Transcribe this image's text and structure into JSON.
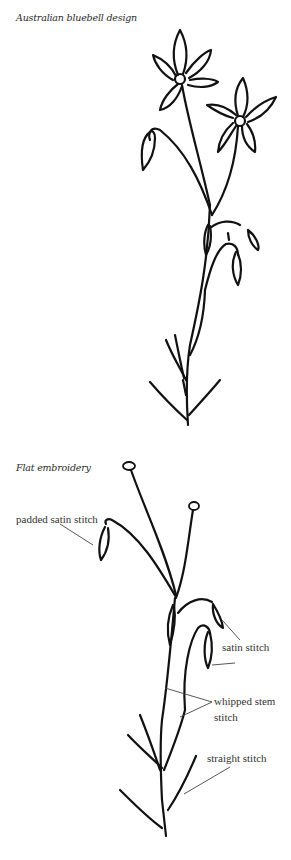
{
  "figures": [
    {
      "caption": "Australian bluebell design"
    },
    {
      "caption": "Flat embroidery",
      "labels": [
        {
          "id": "padded-satin",
          "text": "padded satin stitch"
        },
        {
          "id": "satin",
          "text": "satin stitch"
        },
        {
          "id": "whipped-stem-1",
          "text": "whipped stem"
        },
        {
          "id": "whipped-stem-2",
          "text": "stitch"
        },
        {
          "id": "straight",
          "text": "straight stitch"
        }
      ]
    }
  ],
  "colors": {
    "ink": "#111111",
    "text": "#333333",
    "background": "#ffffff"
  }
}
